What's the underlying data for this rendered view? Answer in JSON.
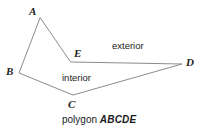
{
  "figure": {
    "width": 217,
    "height": 130,
    "background": "#ffffff",
    "stroke_color": "#8c8c8c",
    "stroke_width": 1,
    "text_color": "#222222"
  },
  "vertices": [
    {
      "id": "A",
      "label": "A",
      "x": 40,
      "y": 18
    },
    {
      "id": "B",
      "label": "B",
      "x": 19,
      "y": 73
    },
    {
      "id": "C",
      "label": "C",
      "x": 73,
      "y": 95
    },
    {
      "id": "D",
      "label": "D",
      "x": 182,
      "y": 64
    },
    {
      "id": "E",
      "label": "E",
      "x": 71,
      "y": 62
    }
  ],
  "edges": [
    {
      "from": "A",
      "to": "B"
    },
    {
      "from": "B",
      "to": "C"
    },
    {
      "from": "C",
      "to": "D"
    },
    {
      "from": "D",
      "to": "E"
    },
    {
      "from": "E",
      "to": "A"
    }
  ],
  "path": "M 40 18 L 19 73 L 73 95 L 182 64 L 71 62 Z",
  "regions": {
    "exterior_label": "exterior",
    "interior_label": "interior"
  },
  "caption": {
    "prefix": "polygon ",
    "name": "ABCDE"
  }
}
